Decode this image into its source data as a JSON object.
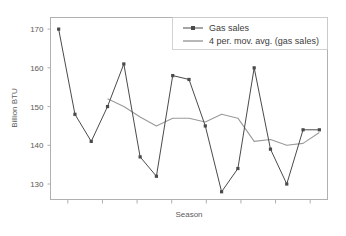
{
  "chart_data": {
    "type": "line",
    "title": "",
    "xlabel": "Season",
    "ylabel": "Billion BTU",
    "ylim": [
      126,
      173
    ],
    "yticks": [
      130,
      140,
      150,
      160,
      170
    ],
    "ytick_labels": [
      "130",
      "140",
      "150",
      "160",
      "170"
    ],
    "grid": false,
    "legend_position": "top-right",
    "x": [
      1,
      2,
      3,
      4,
      5,
      6,
      7,
      8,
      9,
      10,
      11,
      12,
      13,
      14,
      15,
      16,
      17
    ],
    "xtick_count": 8,
    "xtick_labels": [
      "",
      "",
      "",
      "",
      "",
      "",
      "",
      ""
    ],
    "series": [
      {
        "name": "Gas sales",
        "marker": "square",
        "color": "#4a4a4a",
        "values": [
          170,
          148,
          141,
          150,
          161,
          137,
          132,
          158,
          157,
          145,
          128,
          134,
          160,
          139,
          130,
          144,
          144
        ]
      },
      {
        "name": "4 per. mov. avg. (gas sales)",
        "marker": "none",
        "color": "#9a9a9a",
        "values": [
          null,
          null,
          null,
          152.0,
          150.0,
          147.3,
          145.0,
          147.0,
          147.0,
          146.0,
          148.0,
          147.0,
          141.0,
          141.5,
          140.0,
          140.5,
          143.3
        ]
      }
    ]
  },
  "legend": {
    "entries": [
      {
        "label": "Gas sales",
        "swatch": "line-with-marker"
      },
      {
        "label": "4 per. mov. avg. (gas sales)",
        "swatch": "plain-line"
      }
    ]
  },
  "axes": {
    "y_title": "Billion BTU",
    "x_title": "Season",
    "y_tick_0": "130",
    "y_tick_1": "140",
    "y_tick_2": "150",
    "y_tick_3": "160",
    "y_tick_4": "170"
  },
  "colors": {
    "series_primary": "#4a4a4a",
    "series_secondary": "#9a9a9a",
    "frame": "#b0b0b0",
    "text": "#5a5a5a",
    "background": "#ffffff"
  }
}
